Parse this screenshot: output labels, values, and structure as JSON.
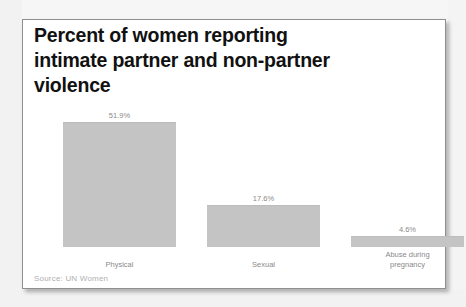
{
  "card": {
    "title_lines": [
      "Percent of women reporting",
      "intimate partner and non-partner",
      "violence"
    ],
    "source": "Source: UN Women"
  },
  "colors": {
    "bar_fill": "#c4c4c4",
    "title_text": "#111111",
    "label_text": "#8a8a8a",
    "source_text": "#b0b0b0",
    "card_background": "#ffffff",
    "card_border": "#8f8f8f"
  },
  "chart_data": {
    "type": "bar",
    "title": "Percent of women reporting intimate partner and non-partner violence",
    "subtitle": "",
    "xlabel": "",
    "ylabel": "",
    "ylim": [
      0,
      55
    ],
    "grid": false,
    "legend": false,
    "axis_visible": false,
    "value_labels_shown": true,
    "categories": [
      "Physical",
      "Sexual",
      "Abuse during pregnancy"
    ],
    "category_lines": [
      [
        "Physical"
      ],
      [
        "Sexual"
      ],
      [
        "Abuse during",
        "pregnancy"
      ]
    ],
    "values": [
      51.9,
      17.6,
      4.6
    ],
    "value_labels": [
      "51.9%",
      "17.6%",
      "4.6%"
    ],
    "units": "percent",
    "source": "Source: UN Women"
  }
}
